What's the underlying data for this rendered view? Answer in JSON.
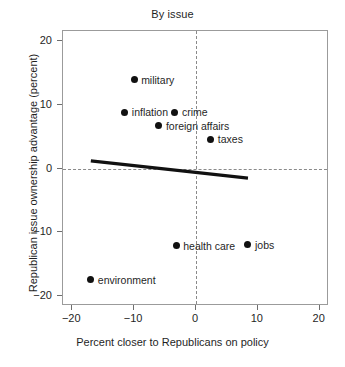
{
  "chart_data": {
    "type": "scatter",
    "title": "By issue",
    "xlabel": "Percent closer to Republicans on policy",
    "ylabel": "Republican issue ownership advantage (percent)",
    "xlim": [
      -21.5,
      21.5
    ],
    "ylim": [
      -21.5,
      21.5
    ],
    "xticks": [
      -20,
      -10,
      0,
      10,
      20
    ],
    "xticklabels": [
      "−20",
      "−10",
      "0",
      "10",
      "20"
    ],
    "yticks": [
      -20,
      -10,
      0,
      10,
      20
    ],
    "yticklabels": [
      "−20",
      "−10",
      "0",
      "10",
      "20"
    ],
    "grid": false,
    "legend": null,
    "reference_lines": [
      {
        "name": "zero-horizontal",
        "axis": "y",
        "value": 0,
        "style": "dashed"
      },
      {
        "name": "zero-vertical",
        "axis": "x",
        "value": 0,
        "style": "dashed"
      }
    ],
    "points": [
      {
        "label": "military",
        "x": -10.0,
        "y": 13.9,
        "label_side": "right"
      },
      {
        "label": "inflation",
        "x": -11.5,
        "y": 8.8,
        "label_side": "right"
      },
      {
        "label": "crime",
        "x": -3.4,
        "y": 8.8,
        "label_side": "right"
      },
      {
        "label": "foreign affairs",
        "x": -6.0,
        "y": 6.7,
        "label_side": "right"
      },
      {
        "label": "taxes",
        "x": 2.4,
        "y": 4.6,
        "label_side": "right"
      },
      {
        "label": "health care",
        "x": -3.2,
        "y": -12.1,
        "label_side": "right"
      },
      {
        "label": "jobs",
        "x": 8.4,
        "y": -11.9,
        "label_side": "right"
      },
      {
        "label": "environment",
        "x": -17.0,
        "y": -17.4,
        "label_side": "right"
      }
    ],
    "fit_line": {
      "name": "regression-line",
      "x_start": -17.0,
      "y_start": 1.2,
      "x_end": 8.4,
      "y_end": -1.5,
      "slope": -0.106,
      "intercept": -0.6,
      "color": "#111111",
      "width_px": 3
    },
    "colors": {
      "point": "#111111",
      "line": "#111111",
      "frame": "#9b9b9b",
      "reference": "#8a8a8a",
      "text": "#1f1f1f",
      "background": "#ffffff"
    }
  }
}
